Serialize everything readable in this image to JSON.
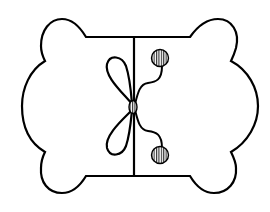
{
  "diagram": {
    "title": "",
    "stroke_color": "#000000",
    "fill_color": "#ffffff",
    "hatch_color": "#000000",
    "parts": [
      {
        "id": "outline",
        "label": "bone-outline"
      },
      {
        "id": "divider",
        "label": "center-divider-line"
      },
      {
        "id": "bow",
        "label": "bow-loops"
      },
      {
        "id": "knot",
        "label": "center-knot"
      },
      {
        "id": "bead-top",
        "label": "upper-hatched-bead"
      },
      {
        "id": "bead-bottom",
        "label": "lower-hatched-bead"
      }
    ]
  }
}
